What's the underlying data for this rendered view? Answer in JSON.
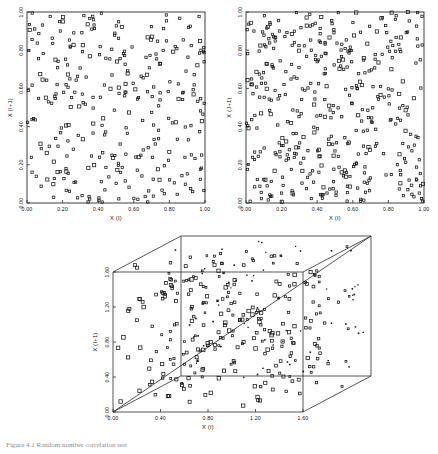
{
  "figure": {
    "caption": "Figure 4.1  Random number correlation test",
    "panels": [
      {
        "id": "panel-top-left",
        "xlabel": "X (I)",
        "ylabel": "X (I+1)",
        "xticks": [
          "0.00",
          "0.20",
          "0.40",
          "0.60",
          "0.80",
          "1.00"
        ],
        "yticks": [
          "0.00",
          "0.20",
          "0.40",
          "0.60",
          "0.80",
          "1.00"
        ],
        "xlim": [
          0,
          1
        ],
        "ylim": [
          0,
          1
        ],
        "n_points": 300,
        "seed": 17
      },
      {
        "id": "panel-top-right",
        "xlabel": "X (I)",
        "ylabel": "X (J+1)",
        "xticks": [
          "0.00",
          "0.20",
          "0.40",
          "0.60",
          "0.80",
          "1.00"
        ],
        "yticks": [
          "0.00",
          "0.20",
          "0.40",
          "0.60",
          "0.80",
          "1.00"
        ],
        "xlim": [
          0,
          1
        ],
        "ylim": [
          0,
          1
        ],
        "n_points": 420,
        "seed": 91
      }
    ],
    "panel3d": {
      "id": "panel-bottom-3d",
      "xlabel": "X (I)",
      "ylabel": "X (I+1)",
      "xticks": [
        "0.00",
        "0.40",
        "0.80",
        "1.20",
        "1.60"
      ],
      "yticks": [
        "0.00",
        "0.40",
        "0.80",
        "1.20",
        "1.60"
      ],
      "xlim": [
        0,
        1.6
      ],
      "ylim": [
        0,
        1.6
      ],
      "zlim": [
        0,
        1.6
      ],
      "n_points": 330,
      "seed": 53
    }
  },
  "chart_data": [
    {
      "type": "scatter",
      "title": "",
      "xlabel": "X (I)",
      "ylabel": "X (I+1)",
      "xlim": [
        0,
        1
      ],
      "ylim": [
        0,
        1
      ],
      "xticks": [
        0.0,
        0.2,
        0.4,
        0.6,
        0.8,
        1.0
      ],
      "yticks": [
        0.0,
        0.2,
        0.4,
        0.6,
        0.8,
        1.0
      ],
      "grid": false,
      "legend": "none",
      "marker": "open-square",
      "n_points": 300,
      "description": "Successive pseudo-random numbers plotted as lag-1 pairs; points fill the unit square with mild streaking along diagonal bands."
    },
    {
      "type": "scatter",
      "title": "",
      "xlabel": "X (I)",
      "ylabel": "X (J+1)",
      "xlim": [
        0,
        1
      ],
      "ylim": [
        0,
        1
      ],
      "xticks": [
        0.0,
        0.2,
        0.4,
        0.6,
        0.8,
        1.0
      ],
      "yticks": [
        0.0,
        0.2,
        0.4,
        0.6,
        0.8,
        1.0
      ],
      "grid": false,
      "legend": "none",
      "marker": "open-square",
      "n_points": 420,
      "description": "Denser lag pair scatter over the unit square showing diagonal striping characteristic of a linear congruential generator."
    },
    {
      "type": "scatter",
      "title": "",
      "xlabel": "X (I)",
      "ylabel": "X (I+1)",
      "xlim": [
        0,
        1.6
      ],
      "ylim": [
        0,
        1.6
      ],
      "zlim": [
        0,
        1.6
      ],
      "xticks": [
        0.0,
        0.4,
        0.8,
        1.2,
        1.6
      ],
      "yticks": [
        0.0,
        0.4,
        0.8,
        1.2,
        1.6
      ],
      "grid": false,
      "legend": "none",
      "marker": "open-square",
      "n_points": 330,
      "description": "Three dimensional lag triple scatter drawn inside a wireframe cube; marker size encodes depth so planes of points are visible."
    }
  ]
}
